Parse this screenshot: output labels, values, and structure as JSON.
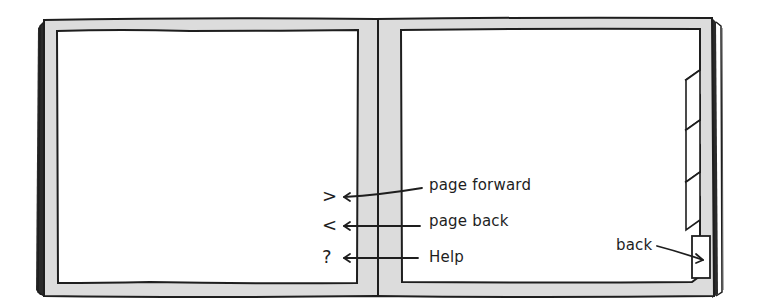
{
  "diagram": {
    "type": "book-ui-wireframe",
    "colors": {
      "ink": "#1e1e1e",
      "frame": "#dcdcdc",
      "page": "#ffffff",
      "page_edge": "#3a3a3a"
    },
    "left_page": {
      "controls": [
        {
          "name": "page-forward",
          "glyph": ">",
          "label": "page forward"
        },
        {
          "name": "page-back",
          "glyph": "<",
          "label": "page back"
        },
        {
          "name": "help",
          "glyph": "?",
          "label": "Help"
        }
      ]
    },
    "right_page": {
      "tabs": [
        {
          "name": "tab-1"
        },
        {
          "name": "tab-2"
        },
        {
          "name": "tab-3"
        }
      ],
      "back_control": {
        "label": "back"
      }
    }
  }
}
